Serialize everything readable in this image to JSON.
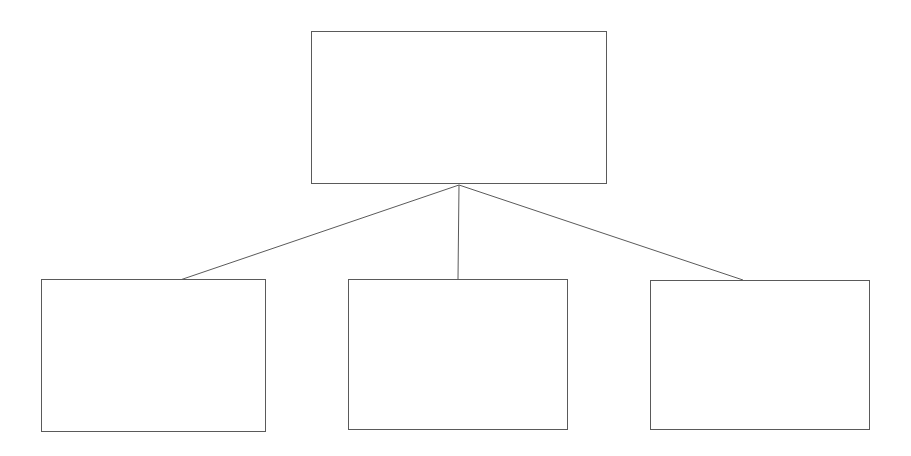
{
  "diagram": {
    "type": "hierarchy-tree",
    "title": "",
    "background_color": "#ffffff",
    "stroke_color": "#5a5a5a",
    "fill_color": "#ffffff",
    "stroke_width_px": 1,
    "canvas": {
      "width": 911,
      "height": 456
    },
    "nodes": [
      {
        "id": "root",
        "role": "parent-node",
        "label": "",
        "x": 311,
        "y": 31,
        "width": 296,
        "height": 153
      },
      {
        "id": "child-1",
        "role": "child-node",
        "label": "",
        "x": 41,
        "y": 279,
        "width": 225,
        "height": 153
      },
      {
        "id": "child-2",
        "role": "child-node",
        "label": "",
        "x": 348,
        "y": 279,
        "width": 220,
        "height": 151
      },
      {
        "id": "child-3",
        "role": "child-node",
        "label": "",
        "x": 650,
        "y": 280,
        "width": 220,
        "height": 150
      }
    ],
    "junction": {
      "x": 459,
      "y": 185
    },
    "connectors": [
      {
        "id": "root-to-child-1",
        "from": "root",
        "to": "child-1",
        "x1": 459,
        "y1": 185,
        "x2": 180,
        "y2": 280
      },
      {
        "id": "root-to-child-2",
        "from": "root",
        "to": "child-2",
        "x1": 459,
        "y1": 185,
        "x2": 458,
        "y2": 279
      },
      {
        "id": "root-to-child-3",
        "from": "root",
        "to": "child-3",
        "x1": 459,
        "y1": 185,
        "x2": 743,
        "y2": 280
      }
    ]
  }
}
